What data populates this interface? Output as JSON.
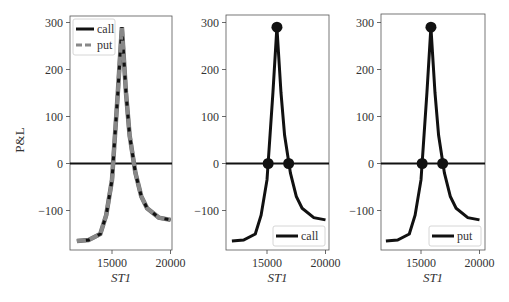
{
  "figure": {
    "ylabel": "P&L",
    "xlabel": "ST1"
  },
  "panels": [
    {
      "id": "left",
      "legend": [
        {
          "label": "call",
          "style": "solid",
          "color": "#111111"
        },
        {
          "label": "put",
          "style": "dashed",
          "color": "#808080"
        }
      ],
      "legend_position": "upper left",
      "markers": false
    },
    {
      "id": "middle",
      "legend": [
        {
          "label": "call",
          "style": "solid",
          "color": "#111111"
        }
      ],
      "legend_position": "lower right",
      "markers": true
    },
    {
      "id": "right",
      "legend": [
        {
          "label": "put",
          "style": "solid",
          "color": "#111111"
        }
      ],
      "legend_position": "lower right",
      "markers": true
    }
  ],
  "axes": {
    "yticks": [
      "300",
      "200",
      "100",
      "0",
      "−100"
    ],
    "xticks": [
      "15000",
      "20000"
    ]
  },
  "chart_data": [
    {
      "type": "line",
      "title": "",
      "xlabel": "ST1",
      "ylabel": "P&L",
      "xlim": [
        11500,
        20300
      ],
      "ylim": [
        -185,
        315
      ],
      "grid": false,
      "legend_position": "upper left",
      "hline": 0,
      "x": [
        12000,
        13000,
        14000,
        14500,
        15000,
        15500,
        15850,
        16200,
        16500,
        17000,
        17500,
        18000,
        19000,
        20000
      ],
      "series": [
        {
          "name": "call",
          "values": [
            -165,
            -163,
            -150,
            -110,
            -35,
            150,
            290,
            150,
            60,
            -20,
            -70,
            -95,
            -115,
            -120
          ]
        },
        {
          "name": "put",
          "values": [
            -165,
            -163,
            -150,
            -110,
            -35,
            150,
            290,
            150,
            60,
            -20,
            -70,
            -95,
            -115,
            -120
          ]
        }
      ]
    },
    {
      "type": "line",
      "title": "",
      "xlabel": "ST1",
      "ylabel": "",
      "xlim": [
        11500,
        20300
      ],
      "ylim": [
        -185,
        315
      ],
      "grid": false,
      "legend_position": "lower right",
      "hline": 0,
      "x": [
        12000,
        13000,
        14000,
        14500,
        15000,
        15500,
        15850,
        16200,
        16500,
        17000,
        17500,
        18000,
        19000,
        20000
      ],
      "series": [
        {
          "name": "call",
          "values": [
            -165,
            -163,
            -150,
            -110,
            -35,
            150,
            290,
            150,
            60,
            -20,
            -70,
            -95,
            -115,
            -120
          ]
        }
      ],
      "markers": [
        {
          "x": 15850,
          "y": 290
        },
        {
          "x": 15100,
          "y": 0
        },
        {
          "x": 16850,
          "y": 0
        }
      ]
    },
    {
      "type": "line",
      "title": "",
      "xlabel": "ST1",
      "ylabel": "",
      "xlim": [
        11500,
        20300
      ],
      "ylim": [
        -185,
        315
      ],
      "grid": false,
      "legend_position": "lower right",
      "hline": 0,
      "x": [
        12000,
        13000,
        14000,
        14500,
        15000,
        15500,
        15850,
        16200,
        16500,
        17000,
        17500,
        18000,
        19000,
        20000
      ],
      "series": [
        {
          "name": "put",
          "values": [
            -165,
            -163,
            -150,
            -110,
            -35,
            150,
            290,
            150,
            60,
            -20,
            -70,
            -95,
            -115,
            -120
          ]
        }
      ],
      "markers": [
        {
          "x": 15850,
          "y": 290
        },
        {
          "x": 15100,
          "y": 0
        },
        {
          "x": 16850,
          "y": 0
        }
      ]
    }
  ]
}
